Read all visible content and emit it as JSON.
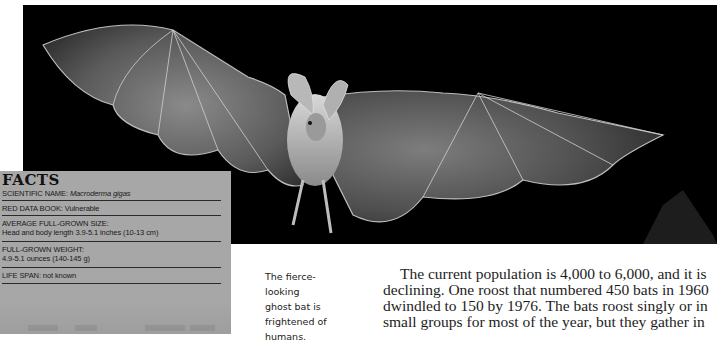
{
  "photo": {
    "subject": "ghost bat in flight with wings spread",
    "background_color": "#000000"
  },
  "facts": {
    "title": "FACTS",
    "background_color": "#a7a7a7",
    "rows": [
      {
        "label": "SCIENTIFIC NAME:",
        "value": "Macroderma gigas"
      },
      {
        "label": "RED DATA BOOK:",
        "value": "Vulnerable"
      },
      {
        "label": "AVERAGE FULL-GROWN SIZE:",
        "value": "Head and body length 3.9-5.1 inches (10-13 cm)"
      },
      {
        "label": "FULL-GROWN WEIGHT:",
        "value": "4.9-5.1 ounces (140-145 g)"
      },
      {
        "label": "LIFE SPAN:",
        "value": "not known"
      }
    ]
  },
  "caption": {
    "lines": [
      "The fierce-looking",
      "ghost bat is",
      "frightened of",
      "humans."
    ]
  },
  "body": {
    "lines": [
      "The current population is 4,000 to 6,000, and it is",
      "declining. One roost that numbered 450 bats in 1960",
      "dwindled to 150 by 1976. The bats roost singly or in",
      "small groups for most of the year, but they gather in"
    ]
  }
}
